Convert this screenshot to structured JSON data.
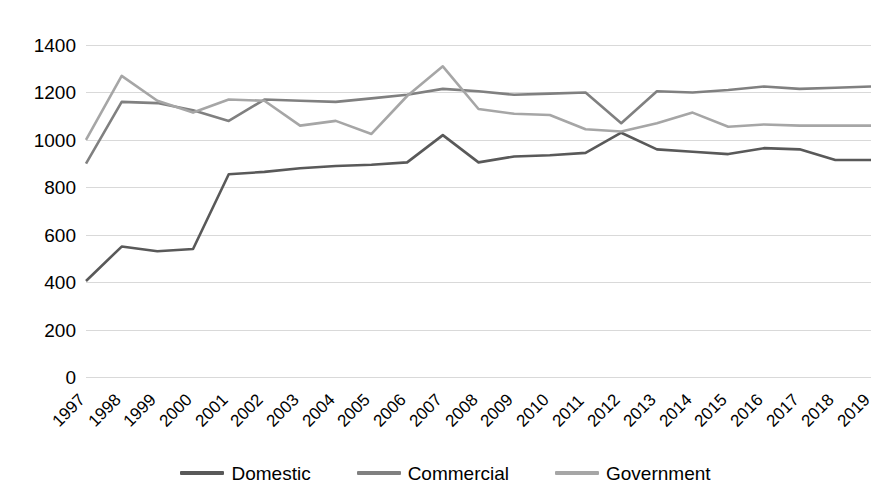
{
  "chart_data": {
    "type": "line",
    "title": "",
    "xlabel": "",
    "ylabel": "",
    "grid": true,
    "legend_position": "bottom",
    "ylim": [
      0,
      1400
    ],
    "ytick_step": 200,
    "yticks": [
      1400,
      1200,
      1000,
      800,
      600,
      400,
      200,
      0
    ],
    "ytick_labels": [
      "1400",
      "1200",
      "1000",
      "800",
      "600",
      "400",
      "200",
      "0"
    ],
    "categories": [
      "1997",
      "1998",
      "1999",
      "2000",
      "2001",
      "2002",
      "2003",
      "2004",
      "2005",
      "2006",
      "2007",
      "2008",
      "2009",
      "2010",
      "2011",
      "2012",
      "2013",
      "2014",
      "2015",
      "2016",
      "2017",
      "2018",
      "2019"
    ],
    "series": [
      {
        "name": "Domestic",
        "color": "#595959",
        "values": [
          405,
          550,
          530,
          540,
          855,
          865,
          880,
          890,
          895,
          905,
          1020,
          905,
          930,
          935,
          945,
          1030,
          960,
          950,
          940,
          965,
          960,
          915,
          915
        ]
      },
      {
        "name": "Commercial",
        "color": "#808080",
        "values": [
          900,
          1160,
          1155,
          1125,
          1080,
          1170,
          1165,
          1160,
          1175,
          1190,
          1215,
          1205,
          1190,
          1195,
          1200,
          1070,
          1205,
          1200,
          1210,
          1225,
          1215,
          1220,
          1225
        ]
      },
      {
        "name": "Government",
        "color": "#a6a6a6",
        "values": [
          1000,
          1270,
          1165,
          1115,
          1170,
          1165,
          1060,
          1080,
          1025,
          1185,
          1310,
          1130,
          1110,
          1105,
          1045,
          1035,
          1070,
          1115,
          1055,
          1065,
          1060,
          1060,
          1060
        ]
      }
    ]
  },
  "legend": {
    "items": [
      {
        "label": "Domestic",
        "color": "#595959"
      },
      {
        "label": "Commercial",
        "color": "#808080"
      },
      {
        "label": "Government",
        "color": "#a6a6a6"
      }
    ]
  }
}
